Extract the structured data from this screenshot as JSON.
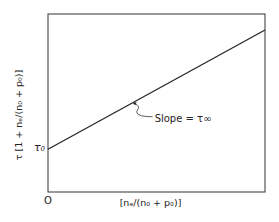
{
  "chart_data": {
    "type": "line",
    "title": "",
    "xlabel": "[nₑ/(n₀ + p₀)]",
    "ylabel": "τ [1 + nₑ/(n₀ + p₀)]",
    "x_tick_labels": [
      "O"
    ],
    "y_tick_labels": [
      "τ₀"
    ],
    "xlim": [
      0,
      1
    ],
    "ylim": [
      0,
      1
    ],
    "grid": false,
    "series": [
      {
        "name": "τ[1 + nₑ/(n₀+p₀)] vs nₑ/(n₀+p₀)",
        "x": [
          0,
          1
        ],
        "y": [
          0.24,
          0.91
        ]
      }
    ],
    "annotations": [
      {
        "text": "Slope = τ∞",
        "target_x": 0.39
      }
    ]
  }
}
